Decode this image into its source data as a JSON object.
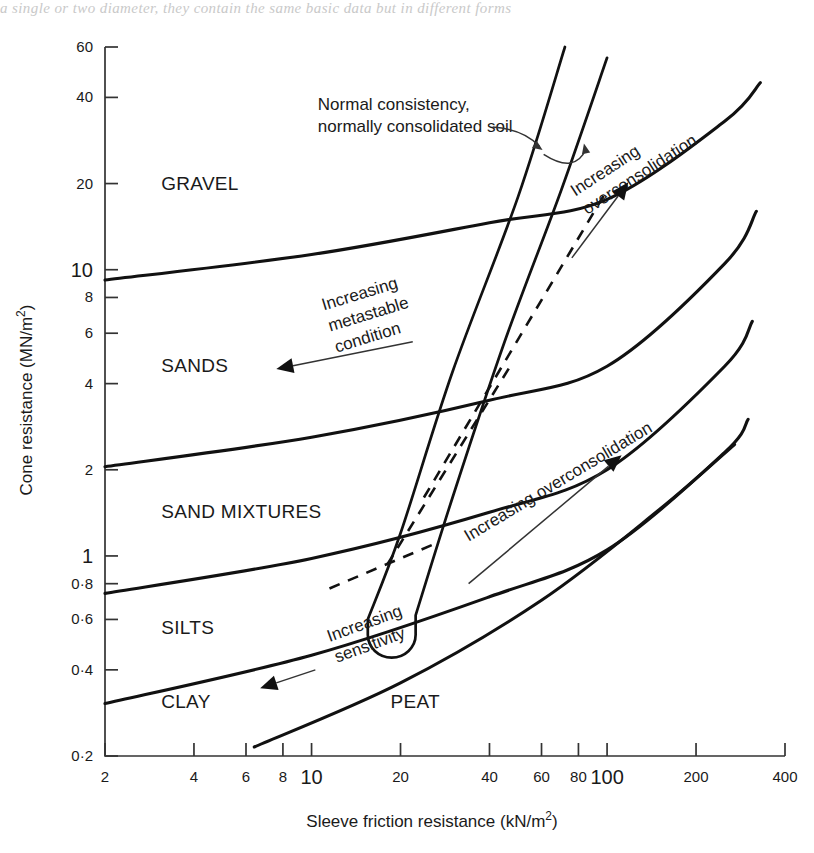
{
  "page": {
    "bleed_text": "a single or two diameter, they contain the same basic data but in different forms"
  },
  "chart_data": {
    "type": "line",
    "title": "",
    "xlabel": "Sleeve friction resistance (kN/m²)",
    "ylabel": "Cone resistance (MN/m²)",
    "xscale": "log",
    "yscale": "log",
    "xlim": [
      2,
      400
    ],
    "ylim": [
      0.2,
      60
    ],
    "grid": false,
    "legend": "none",
    "xticks": [
      {
        "value": 2,
        "label": "2",
        "major": false
      },
      {
        "value": 4,
        "label": "4",
        "major": false
      },
      {
        "value": 6,
        "label": "6",
        "major": false
      },
      {
        "value": 8,
        "label": "8",
        "major": false
      },
      {
        "value": 10,
        "label": "10",
        "major": true
      },
      {
        "value": 20,
        "label": "20",
        "major": false
      },
      {
        "value": 40,
        "label": "40",
        "major": false
      },
      {
        "value": 60,
        "label": "60",
        "major": false
      },
      {
        "value": 80,
        "label": "80",
        "major": false
      },
      {
        "value": 100,
        "label": "100",
        "major": true
      },
      {
        "value": 200,
        "label": "200",
        "major": false
      },
      {
        "value": 400,
        "label": "400",
        "major": false
      }
    ],
    "yticks": [
      {
        "value": 60,
        "label": "60",
        "major": false
      },
      {
        "value": 40,
        "label": "40",
        "major": false
      },
      {
        "value": 20,
        "label": "20",
        "major": false
      },
      {
        "value": 10,
        "label": "10",
        "major": true
      },
      {
        "value": 8,
        "label": "8",
        "major": false
      },
      {
        "value": 6,
        "label": "6",
        "major": false
      },
      {
        "value": 4,
        "label": "4",
        "major": false
      },
      {
        "value": 2,
        "label": "2",
        "major": false
      },
      {
        "value": 1,
        "label": "1",
        "major": true
      },
      {
        "value": 0.8,
        "label": "0·8",
        "major": false
      },
      {
        "value": 0.6,
        "label": "0·6",
        "major": false
      },
      {
        "value": 0.4,
        "label": "0·4",
        "major": false
      },
      {
        "value": 0.2,
        "label": "0·2",
        "major": false
      }
    ],
    "soil_regions": [
      {
        "name": "GRAVEL",
        "label": "GRAVEL",
        "x": 3.1,
        "y": 20.0
      },
      {
        "name": "SANDS",
        "label": "SANDS",
        "x": 3.1,
        "y": 4.6
      },
      {
        "name": "SAND MIXTURES",
        "label": "SAND MIXTURES",
        "x": 3.1,
        "y": 1.42
      },
      {
        "name": "SILTS",
        "label": "SILTS",
        "x": 3.1,
        "y": 0.56
      },
      {
        "name": "CLAY",
        "label": "CLAY",
        "x": 3.1,
        "y": 0.31
      },
      {
        "name": "PEAT",
        "label": "PEAT",
        "x": 18.5,
        "y": 0.31
      }
    ],
    "boundaries": [
      {
        "name": "gravel-sands-boundary",
        "points": [
          [
            2,
            9.2
          ],
          [
            10,
            11.3
          ],
          [
            40,
            14.6
          ],
          [
            100,
            17.6
          ],
          [
            250,
            33.0
          ],
          [
            330,
            45.0
          ]
        ]
      },
      {
        "name": "sands-sandmix-boundary",
        "points": [
          [
            2,
            2.05
          ],
          [
            10,
            2.6
          ],
          [
            40,
            3.5
          ],
          [
            100,
            4.6
          ],
          [
            250,
            10.5
          ],
          [
            320,
            16.0
          ]
        ]
      },
      {
        "name": "sandmix-silts-boundary",
        "points": [
          [
            2,
            0.74
          ],
          [
            10,
            0.98
          ],
          [
            40,
            1.42
          ],
          [
            100,
            2.0
          ],
          [
            250,
            4.6
          ],
          [
            310,
            6.6
          ]
        ]
      },
      {
        "name": "silts-clay-boundary",
        "points": [
          [
            2,
            0.305
          ],
          [
            10,
            0.45
          ],
          [
            40,
            0.72
          ],
          [
            100,
            1.05
          ],
          [
            250,
            2.3
          ],
          [
            300,
            3.0
          ]
        ]
      },
      {
        "name": "clay-peat-boundary",
        "points": [
          [
            6.4,
            0.215
          ],
          [
            20,
            0.36
          ],
          [
            60,
            0.7
          ],
          [
            150,
            1.45
          ],
          [
            270,
            2.45
          ]
        ]
      }
    ],
    "normal_consistency_lines": [
      {
        "name": "nc-line-left",
        "points": [
          [
            15.5,
            0.6
          ],
          [
            20,
            1.2
          ],
          [
            30,
            4.4
          ],
          [
            50,
            18.0
          ],
          [
            72,
            60.0
          ]
        ]
      },
      {
        "name": "nc-line-right",
        "points": [
          [
            22.5,
            0.62
          ],
          [
            30,
            1.6
          ],
          [
            45,
            5.6
          ],
          [
            70,
            19.0
          ],
          [
            100,
            55.0
          ]
        ]
      }
    ],
    "u_loop": {
      "name": "metastable-loop",
      "bottom_x_left": 15.5,
      "bottom_x_right": 22.5,
      "bottom_y": 0.53
    },
    "trend_lines": [
      {
        "name": "trend-dashed-upper",
        "points": [
          [
            24,
            1.6
          ],
          [
            100,
            19.0
          ]
        ],
        "style": "dashed"
      },
      {
        "name": "trend-dashed-mid",
        "points": [
          [
            18,
            0.93
          ],
          [
            47,
            4.6
          ]
        ],
        "style": "dashed"
      },
      {
        "name": "trend-dashed-lower",
        "points": [
          [
            11.5,
            0.77
          ],
          [
            26,
            1.1
          ]
        ],
        "style": "dashed"
      }
    ],
    "annotations": [
      {
        "name": "normal-consistency-note",
        "lines": [
          "Normal consistency,",
          "normally consolidated soil"
        ],
        "x": 10.5,
        "y": 36.0,
        "rotation": 0
      },
      {
        "name": "increasing-overconsolidation-upper",
        "lines": [
          "Increasing",
          "overconsolidation"
        ],
        "x": 78,
        "y": 18.0,
        "rotation": -33,
        "arrow": "up-right"
      },
      {
        "name": "increasing-metastable-condition",
        "lines": [
          "Increasing",
          "metastable",
          "condition"
        ],
        "x": 11.0,
        "y": 7.2,
        "rotation": -17,
        "arrow": "left"
      },
      {
        "name": "increasing-overconsolidation-lower",
        "lines": [
          "Increasing overconsolidation"
        ],
        "x": 34,
        "y": 1.12,
        "rotation": -31,
        "arrow": "up-right"
      },
      {
        "name": "increasing-sensitivity",
        "lines": [
          "Increasing",
          "sensitivity"
        ],
        "x": 11.5,
        "y": 0.5,
        "rotation": -20,
        "arrow": "left"
      }
    ]
  }
}
